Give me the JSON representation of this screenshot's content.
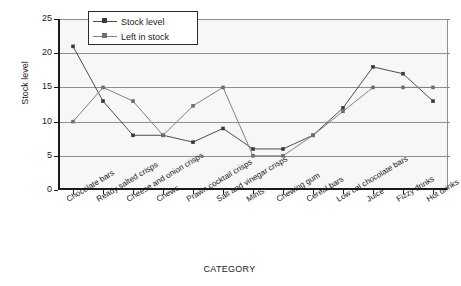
{
  "chart_data": {
    "type": "line",
    "title": "",
    "xlabel": "CATEGORY",
    "ylabel": "Stock level",
    "ylim": [
      0,
      25
    ],
    "yticks": [
      0,
      5,
      10,
      15,
      20,
      25
    ],
    "grid": true,
    "legend_position": "top-center",
    "categories": [
      "Chocolate bars",
      "Ready salted crisps",
      "Cheese and onion crisps",
      "Chews",
      "Prawn cocktail crisps",
      "Salt and vinegar crisps",
      "Mints",
      "Chewing gum",
      "Cereal bars",
      "Low cal chocolate bars",
      "Juice",
      "Fizzy drinks",
      "Hot drinks"
    ],
    "series": [
      {
        "name": "Stock level",
        "color": "#4d4d4d",
        "values": [
          21,
          13,
          8,
          8,
          7,
          9,
          6,
          6,
          8,
          12,
          18,
          17,
          13
        ]
      },
      {
        "name": "Left in stock",
        "color": "#808080",
        "values": [
          10,
          15,
          13,
          8,
          12.3,
          15,
          5,
          5,
          8,
          11.5,
          15,
          15,
          15
        ]
      }
    ]
  },
  "axes": {
    "y_title": "Stock level",
    "x_title": "CATEGORY",
    "y_tick_labels": [
      "25",
      "20",
      "15",
      "10",
      "5",
      "0"
    ]
  },
  "legend": {
    "items": [
      {
        "label": "Stock level"
      },
      {
        "label": "Left in stock"
      }
    ]
  },
  "colors": {
    "series_stock_level": "#4d4d4d",
    "series_left_in_stock": "#808080",
    "grid": "#8f8f8f",
    "axis": "#1a1a1a",
    "plot_background": "#f7f7f7"
  }
}
